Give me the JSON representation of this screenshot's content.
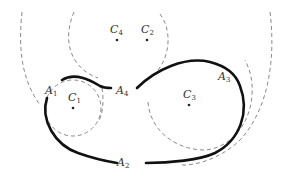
{
  "diagram": {
    "centers": [
      {
        "id": "C1",
        "letter": "C",
        "sub": "1",
        "x": 73,
        "y": 108
      },
      {
        "id": "C2",
        "letter": "C",
        "sub": "2",
        "x": 147,
        "y": 40
      },
      {
        "id": "C3",
        "letter": "C",
        "sub": "3",
        "x": 189,
        "y": 105
      },
      {
        "id": "C4",
        "letter": "C",
        "sub": "4",
        "x": 117,
        "y": 40
      }
    ],
    "arc_labels": [
      {
        "id": "A1",
        "letter": "A",
        "sub": "1"
      },
      {
        "id": "A2",
        "letter": "A",
        "sub": "2"
      },
      {
        "id": "A3",
        "letter": "A",
        "sub": "3"
      },
      {
        "id": "A4",
        "letter": "A",
        "sub": "4"
      }
    ],
    "colors": {
      "arc": "#111111",
      "dashed_circle": "#8a8a8a",
      "label": "#333333"
    }
  }
}
